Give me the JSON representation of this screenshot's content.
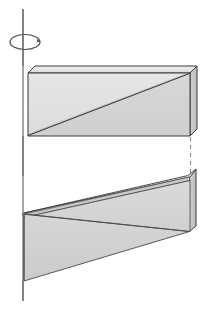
{
  "figure": {
    "caption": "",
    "width": 209,
    "height": 310,
    "background": "#ffffff"
  },
  "colors": {
    "outline": "#3a3a3a",
    "outline_soft": "#5a5a5a",
    "face_light": "#e2e2e2",
    "face_mid": "#d4d4d4",
    "face_dark": "#c2c2c2",
    "face_top_bevel": "#ebebeb",
    "axis_line": "#6b6b6b",
    "dashed_line": "#8a8a8a",
    "white": "#ffffff"
  },
  "axis": {
    "name": "axis-of-revolution",
    "x": 23,
    "y_top": 9,
    "y_bottom": 301,
    "stroke_width": 1.2,
    "label": ""
  },
  "rotation_arrow": {
    "name": "rotation-direction-ellipse",
    "cx": 25,
    "cy": 42,
    "rx": 15,
    "ry": 7.5,
    "stroke_width": 1.2,
    "label": ""
  },
  "upper_slab": {
    "name": "upper-slab",
    "label": "",
    "front_face": "28,73 190,73 190,136 28,136",
    "top_bevel": "28,73 35,66 197,66 190,73",
    "side_face": "190,73 197,66 197,129 190,136",
    "diagonal": "28,135 189,74",
    "fill_upper": "#e0e0e0",
    "fill_lower": "#d2d2d2",
    "bounds": {
      "left": 28,
      "right": 197,
      "top": 66,
      "bottom": 136
    }
  },
  "dashed_connector": {
    "name": "hidden-edge-dashed",
    "x": 190,
    "y_top": 136,
    "y_bottom": 176,
    "dash_pattern": "4,4",
    "stroke_width": 1.1
  },
  "lower_wedge": {
    "name": "lower-wedge",
    "label": "",
    "ramp_face": "24,213 189,176 196,169 196,226 31,226",
    "ramp_band": "24,213 188,175 190,179 26,216",
    "side_face": "189,176 196,169 196,226 189,231",
    "lower_face": "24,214 189,231 24,281",
    "fill_ramp": "#d6d6d6",
    "fill_band": "#c9c9c9",
    "fill_lower": "#d2d2d2",
    "bounds": {
      "left": 24,
      "right": 196,
      "top": 169,
      "bottom": 281
    }
  },
  "annotations": {
    "items": []
  },
  "legend": {
    "visible": false,
    "entries": []
  }
}
